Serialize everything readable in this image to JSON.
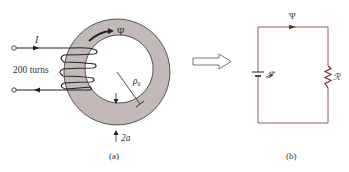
{
  "figure": {
    "panel_a": {
      "caption": "(a)",
      "current_label": "I",
      "turns_label": "200 turns",
      "flux_label": "Ψ",
      "radius_label": "ρ",
      "radius_subscript": "0",
      "thickness_label": "2a"
    },
    "transform_arrow": "hollow-right-arrow",
    "panel_b": {
      "caption": "(b)",
      "flux_label": "Ψ",
      "source_label": "𝓕",
      "reluctance_label": "ℛ"
    },
    "colors": {
      "core_fill": "#c4b9b9",
      "circuit_wire": "#8a4a4a",
      "resistor": "#7a2a2a",
      "ink": "#222222"
    }
  }
}
